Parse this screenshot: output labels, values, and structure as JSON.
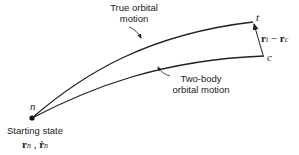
{
  "diagram": {
    "points": {
      "start": {
        "label": "n",
        "x": 32,
        "y": 118
      },
      "true_end": {
        "label": "t",
        "x": 253,
        "y": 22
      },
      "twobody_end": {
        "label": "c",
        "x": 264,
        "y": 56
      }
    },
    "curves": [
      {
        "name": "true-orbital-motion",
        "label_line1": "True orbital",
        "label_line2": "motion"
      },
      {
        "name": "two-body-orbital-motion",
        "label_line1": "Two-body",
        "label_line2": "orbital motion"
      }
    ],
    "difference_vector": {
      "r_t": "r",
      "sub_t": "t",
      "minus": " − ",
      "r_c": "r",
      "sub_c": "c"
    },
    "start_state": {
      "label": "Starting state",
      "r": "r",
      "sub_n": "n",
      "comma": " , ",
      "rdot": "ṙ",
      "sub_n2": "n"
    },
    "stroke_color": "#222222"
  }
}
